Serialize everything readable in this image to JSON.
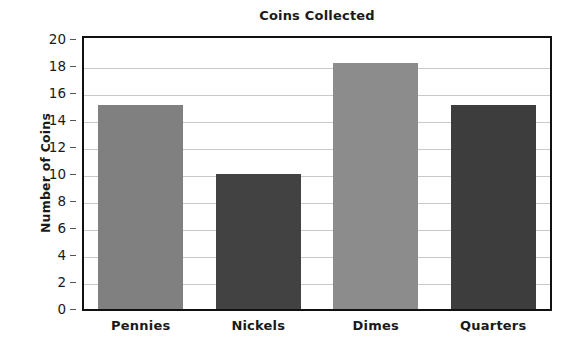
{
  "chart_data": {
    "type": "bar",
    "title": "Coins Collected",
    "xlabel": "",
    "ylabel": "Number of Coins",
    "categories": [
      "Pennies",
      "Nickels",
      "Dimes",
      "Quarters"
    ],
    "values": [
      15.1,
      10.0,
      18.2,
      15.1
    ],
    "ylim": [
      0,
      20
    ],
    "ytick_labels": [
      "0",
      "2",
      "4",
      "6",
      "8",
      "10",
      "12",
      "14",
      "16",
      "18",
      "20"
    ],
    "ytick_values": [
      0,
      2,
      4,
      6,
      8,
      10,
      12,
      14,
      16,
      18,
      20
    ],
    "grid": "horizontal",
    "legend": "none",
    "bar_colors": [
      "#808080",
      "#424242",
      "#8c8c8c",
      "#3d3d3d"
    ],
    "frame_color": "#111111",
    "gridline_color": "#c9c9c9",
    "background_color": "#ffffff",
    "text_color": "#1a1a1a"
  }
}
